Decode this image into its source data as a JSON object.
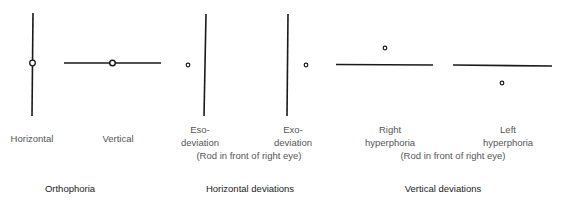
{
  "figure": {
    "panels": [
      {
        "id": "horizontal",
        "label": "Horizontal",
        "rod": "vertical",
        "light": "centered"
      },
      {
        "id": "vertical",
        "label": "Vertical",
        "rod": "horizontal",
        "light": "centered"
      },
      {
        "id": "eso",
        "label_line1": "Eso-",
        "label_line2": "deviation",
        "rod": "vertical",
        "light": "left of rod"
      },
      {
        "id": "exo",
        "label_line1": "Exo-",
        "label_line2": "deviation",
        "rod": "vertical",
        "light": "right of rod"
      },
      {
        "id": "right-hyper",
        "label_line1": "Right",
        "label_line2": "hyperphoria",
        "rod": "horizontal",
        "light": "above rod"
      },
      {
        "id": "left-hyper",
        "label_line1": "Left",
        "label_line2": "hyperphoria",
        "rod": "horizontal",
        "light": "below rod"
      }
    ],
    "notes": {
      "horizontal_rod_note": "(Rod in front of right eye)",
      "vertical_rod_note": "(Rod in front of right eye)"
    },
    "groups": {
      "orthophoria": "Orthophoria",
      "horizontal_deviations": "Horizontal deviations",
      "vertical_deviations": "Vertical deviations"
    },
    "line_color": "#1a1a1a"
  }
}
